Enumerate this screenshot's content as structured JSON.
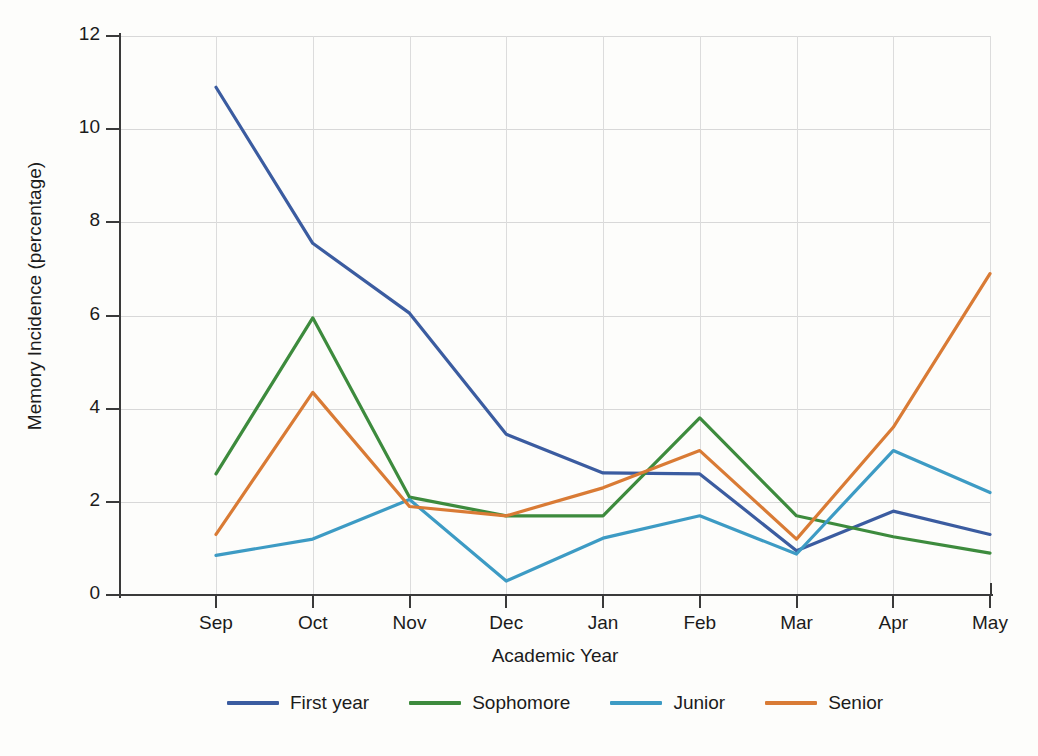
{
  "chart_data": {
    "type": "line",
    "title": "",
    "xlabel": "Academic Year",
    "ylabel": "Memory Incidence (percentage)",
    "categories": [
      "Sep",
      "Oct",
      "Nov",
      "Dec",
      "Jan",
      "Feb",
      "Mar",
      "Apr",
      "May"
    ],
    "x_tick_labels": [
      "Sep",
      "Oct",
      "Nov",
      "Dec",
      "Jan",
      "Feb",
      "Mar",
      "Apr",
      "May"
    ],
    "y_tick_labels": [
      "0",
      "2",
      "4",
      "6",
      "8",
      "10",
      "12"
    ],
    "y_ticks": [
      0,
      2,
      4,
      6,
      8,
      10,
      12
    ],
    "ylim": [
      0,
      12
    ],
    "grid": true,
    "legend_position": "bottom",
    "series": [
      {
        "name": "First year",
        "color": "#3b5ca0",
        "values": [
          10.9,
          7.55,
          6.05,
          3.45,
          2.62,
          2.6,
          0.95,
          1.8,
          1.3
        ]
      },
      {
        "name": "Sophomore",
        "color": "#3d8b3d",
        "values": [
          2.6,
          5.95,
          2.1,
          1.7,
          1.7,
          3.8,
          1.7,
          1.25,
          0.9
        ]
      },
      {
        "name": "Junior",
        "color": "#3d9bc4",
        "values": [
          0.85,
          1.2,
          2.05,
          0.3,
          1.22,
          1.7,
          0.88,
          3.1,
          2.2
        ]
      },
      {
        "name": "Senior",
        "color": "#d97b35",
        "values": [
          1.3,
          4.35,
          1.9,
          1.7,
          2.3,
          3.1,
          1.2,
          3.6,
          6.9
        ]
      }
    ]
  },
  "legend": {
    "items": [
      {
        "label": "First year"
      },
      {
        "label": "Sophomore"
      },
      {
        "label": "Junior"
      },
      {
        "label": "Senior"
      }
    ]
  },
  "axes": {
    "x_title": "Academic Year",
    "y_title": "Memory Incidence (percentage)"
  },
  "colors": {
    "first_year": "#3b5ca0",
    "sophomore": "#3d8b3d",
    "junior": "#3d9bc4",
    "senior": "#d97b35",
    "axis": "#3a3a3a",
    "grid": "#d8d8d8",
    "background": "#fdfdfb"
  }
}
